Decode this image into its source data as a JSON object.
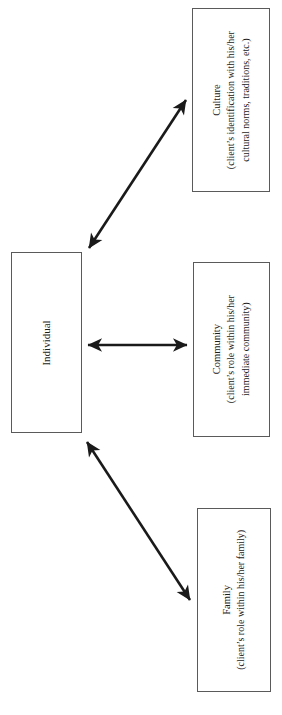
{
  "diagram": {
    "background_color": "#ffffff",
    "box_border_color": "#5a5a5a",
    "arrow_color": "#1a1a1a",
    "text_orientation": "rotated-90-ccw",
    "nodes": [
      {
        "id": "individual",
        "label": "Individual",
        "description": "",
        "description_lines": []
      },
      {
        "id": "culture",
        "label": "Culture",
        "description": "(client’s identification with his/her cultural norms, traditions, etc.)",
        "description_lines": [
          "(client’s identification with his/her",
          "cultural norms, traditions, etc.)"
        ]
      },
      {
        "id": "community",
        "label": "Community",
        "description": "(client’s role within his/her immediate community)",
        "description_lines": [
          "(client’s role within his/her",
          "immediate community)"
        ]
      },
      {
        "id": "family",
        "label": "Family",
        "description": "(client’s role within his/her family)",
        "description_lines": [
          "(client’s role within his/her family)"
        ]
      }
    ],
    "connections": [
      {
        "id": "individual-culture",
        "from": "individual",
        "to": "culture",
        "style": "double-headed-arrow",
        "direction": "diagonal-up"
      },
      {
        "id": "individual-community",
        "from": "individual",
        "to": "community",
        "style": "double-headed-arrow",
        "direction": "horizontal"
      },
      {
        "id": "individual-family",
        "from": "individual",
        "to": "family",
        "style": "double-headed-arrow",
        "direction": "diagonal-down"
      }
    ]
  }
}
